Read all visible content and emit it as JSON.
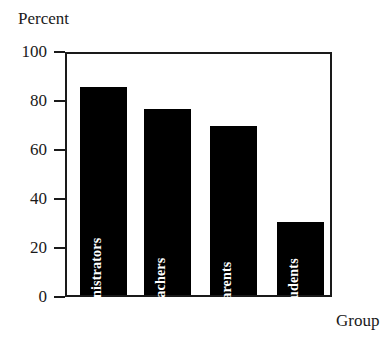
{
  "chart_data": {
    "type": "bar",
    "title": "",
    "categories": [
      "Administrators",
      "Teachers",
      "Parents",
      "Students"
    ],
    "values": [
      85,
      76,
      69,
      30
    ],
    "series": [
      {
        "name": "Percent",
        "values": [
          85,
          76,
          69,
          30
        ]
      }
    ],
    "xlabel": "Group",
    "ylabel": "Percent",
    "ylim": [
      0,
      100
    ],
    "yticks": [
      100,
      80,
      60,
      40,
      20,
      0
    ],
    "ytick_labels": [
      "100",
      "80",
      "60",
      "40",
      "20",
      "0"
    ],
    "grid": false,
    "legend": null,
    "bar_color": "#000000",
    "bar_label_color": "#ffffff",
    "axis_color": "#1a1a1a",
    "background_color": "#ffffff",
    "bar_label_orientation": "vertical-bottom-to-top"
  }
}
